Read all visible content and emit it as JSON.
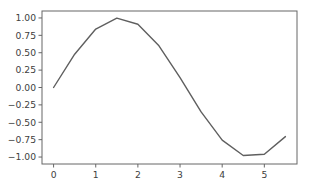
{
  "figure": {
    "background_color": "#ffffff",
    "axes_background_color": "#ffffff",
    "spine_color": "#666666",
    "tick_label_color": "#404040"
  },
  "chart_data": {
    "type": "line",
    "title": "",
    "xlabel": "",
    "ylabel": "",
    "line_color": "#5f5f5f",
    "line_width": 1.4,
    "grid": false,
    "legend": false,
    "legend_position": "none",
    "xlim": [
      -0.275,
      5.775
    ],
    "ylim": [
      -1.1,
      1.1
    ],
    "xticks": [
      0,
      1,
      2,
      3,
      4,
      5
    ],
    "xtick_labels": [
      "0",
      "1",
      "2",
      "3",
      "4",
      "5"
    ],
    "yticks": [
      1.0,
      0.75,
      0.5,
      0.25,
      0.0,
      -0.25,
      -0.5,
      -0.75,
      -1.0
    ],
    "ytick_labels": [
      "1.00",
      "0.75",
      "0.50",
      "0.25",
      "0.00",
      "−0.25",
      "−0.50",
      "−0.75",
      "−1.00"
    ],
    "series": [
      {
        "name": "sin(x)",
        "x": [
          0.0,
          0.5,
          1.0,
          1.5,
          2.0,
          2.5,
          3.0,
          3.5,
          4.0,
          4.5,
          5.0,
          5.5
        ],
        "values": [
          0.0,
          0.479,
          0.841,
          0.997,
          0.909,
          0.599,
          0.141,
          -0.351,
          -0.757,
          -0.978,
          -0.959,
          -0.706
        ]
      }
    ]
  }
}
